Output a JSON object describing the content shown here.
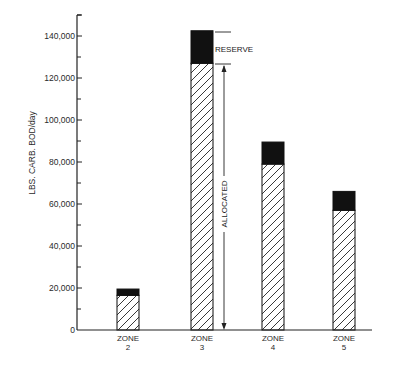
{
  "chart_data": {
    "type": "bar",
    "stacked": true,
    "title": "",
    "xlabel": "",
    "ylabel": "LBS. CARB. BOD/day",
    "ylim": [
      0,
      150000
    ],
    "yticks": [
      0,
      20000,
      40000,
      60000,
      80000,
      100000,
      120000,
      140000
    ],
    "ytick_labels": [
      "0",
      "20,000",
      "40,000",
      "60,000",
      "80,000",
      "100,000",
      "120,000",
      "140,000"
    ],
    "categories": [
      "ZONE 2",
      "ZONE 3",
      "ZONE 4",
      "ZONE 5"
    ],
    "category_lines": [
      [
        "ZONE",
        "2"
      ],
      [
        "ZONE",
        "3"
      ],
      [
        "ZONE",
        "4"
      ],
      [
        "ZONE",
        "5"
      ]
    ],
    "series": [
      {
        "name": "Allocated",
        "pattern": "diagonal-hatch",
        "values": [
          16500,
          127000,
          79000,
          57000
        ]
      },
      {
        "name": "Reserve",
        "color": "#111111",
        "values": [
          3000,
          15500,
          10500,
          9000
        ]
      }
    ],
    "totals": [
      19500,
      142500,
      89500,
      66000
    ],
    "annotations": [
      {
        "text": "RESERVE",
        "target": "ZONE 3 reserve segment"
      },
      {
        "text": "ALLOCATED",
        "target": "ZONE 3 allocated segment",
        "orientation": "vertical"
      }
    ],
    "grid": false,
    "legend": "none"
  }
}
